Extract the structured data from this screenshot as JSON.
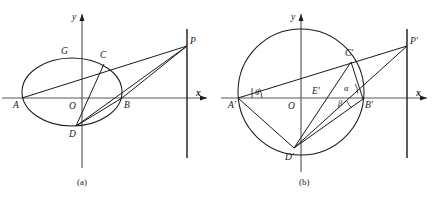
{
  "figure": {
    "caption_a": "(a)",
    "caption_b": "(b)",
    "panel_a": {
      "name": "ellipse-diagram",
      "axis_x_label": "x",
      "axis_y_label": "y",
      "origin_label": "O",
      "points": [
        {
          "id": "A",
          "label": "A",
          "x": 22,
          "y": 98,
          "lx": 13,
          "ly": 108
        },
        {
          "id": "B",
          "label": "B",
          "x": 122,
          "y": 98,
          "lx": 124,
          "ly": 108
        },
        {
          "id": "C",
          "label": "C",
          "x": 104,
          "y": 64,
          "lx": 100,
          "ly": 58
        },
        {
          "id": "D",
          "label": "D",
          "x": 76,
          "y": 126,
          "lx": 69,
          "ly": 137
        },
        {
          "id": "G",
          "label": "G",
          "x": 82,
          "y": 58,
          "lx": 61,
          "ly": 54
        },
        {
          "id": "P",
          "label": "P",
          "x": 187,
          "y": 46,
          "lx": 190,
          "ly": 44
        }
      ],
      "ellipse": {
        "cx": 72,
        "cy": 92,
        "rx": 50,
        "ry": 34
      },
      "directrix_x": 187,
      "x_axis_y": 98,
      "y_axis_x": 82,
      "chords": [
        {
          "name": "A-P",
          "from": "A",
          "to": "P"
        },
        {
          "name": "C-D",
          "from": "C",
          "to": "D"
        },
        {
          "name": "D-B",
          "from": "D",
          "to": "B"
        },
        {
          "name": "B-P",
          "from": "B",
          "to": "P"
        }
      ]
    },
    "panel_b": {
      "name": "circle-diagram",
      "axis_x_label": "x",
      "axis_y_label": "y",
      "origin_label": "O",
      "points": [
        {
          "id": "Ap",
          "label": "A′",
          "x": 238,
          "y": 98,
          "lx": 228,
          "ly": 108
        },
        {
          "id": "Bp",
          "label": "B′",
          "x": 363,
          "y": 99,
          "lx": 365,
          "ly": 108
        },
        {
          "id": "Cp",
          "label": "C′",
          "x": 351,
          "y": 62,
          "lx": 346,
          "ly": 56
        },
        {
          "id": "Dp",
          "label": "D′",
          "x": 294,
          "y": 148,
          "lx": 286,
          "ly": 159
        },
        {
          "id": "Ep",
          "label": "E′",
          "x": 320,
          "y": 99,
          "lx": 312,
          "ly": 93
        },
        {
          "id": "Pp",
          "label": "P′",
          "x": 407,
          "y": 46,
          "lx": 410,
          "ly": 44
        }
      ],
      "angles": [
        {
          "id": "theta",
          "label": "θ",
          "lx": 258,
          "ly": 92
        },
        {
          "id": "alpha",
          "label": "α",
          "lx": 345,
          "ly": 90
        },
        {
          "id": "beta",
          "label": "β",
          "lx": 340,
          "ly": 103
        }
      ],
      "circle": {
        "cx": 301,
        "cy": 92,
        "r": 63
      },
      "directrix_x": 407,
      "x_axis_y": 98,
      "y_axis_x": 301,
      "chords": [
        {
          "name": "Ap-Pp",
          "from": "Ap",
          "to": "Pp"
        },
        {
          "name": "Ap-Dp",
          "from": "Ap",
          "to": "Dp"
        },
        {
          "name": "Cp-Dp",
          "from": "Cp",
          "to": "Dp"
        },
        {
          "name": "Dp-Bp",
          "from": "Dp",
          "to": "Bp"
        },
        {
          "name": "Dp-Pp",
          "from": "Dp",
          "to": "Pp"
        },
        {
          "name": "Cp-Bp",
          "from": "Cp",
          "to": "Bp"
        }
      ]
    }
  },
  "colors": {
    "ink": "#1a1a1a",
    "axis": "#555a5e",
    "background": "#ffffff"
  }
}
